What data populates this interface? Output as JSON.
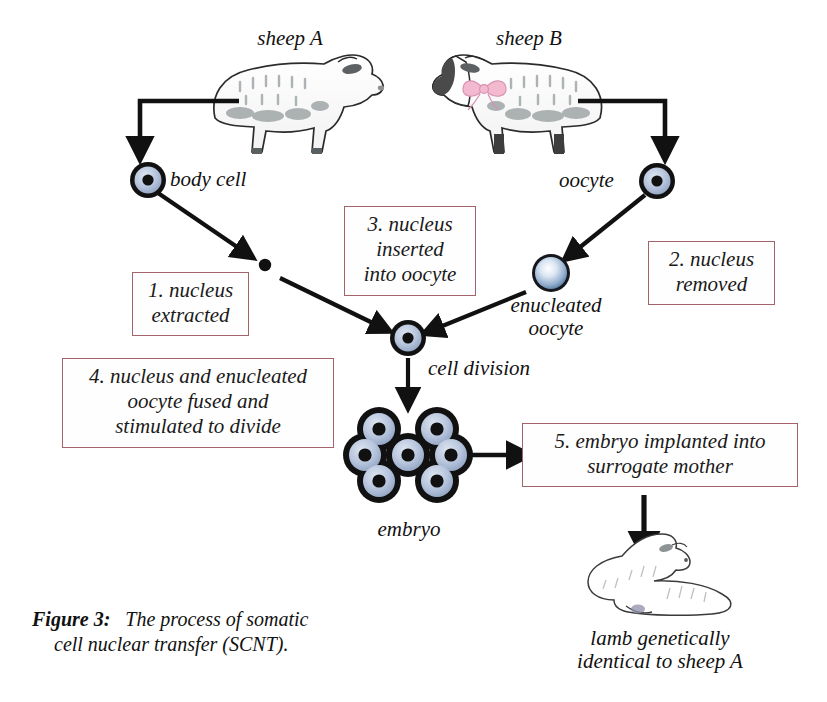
{
  "figure": {
    "caption_bold": "Figure 3:",
    "caption_rest": "The process of somatic",
    "caption_line2": "cell nuclear transfer (SCNT)."
  },
  "colors": {
    "box_border": "#a4636a",
    "cell_ring": "#111111",
    "cell_cytoplasm": "#b9c6de",
    "cell_nucleus": "#111111",
    "enucleated_edge": "#5b7fae",
    "enucleated_center": "#ffffff",
    "arrow": "#111111",
    "text": "#111111",
    "sheep_fleece": "#ffffff",
    "sheep_shading": "#9aa0a2",
    "sheep_b_face": "#4a4a4a",
    "bow_pink": "#f2b9cf"
  },
  "labels": {
    "sheep_a": "sheep A",
    "sheep_b": "sheep B",
    "body_cell": "body cell",
    "oocyte": "oocyte",
    "enucleated_oocyte_line1": "enucleated",
    "enucleated_oocyte_line2": "oocyte",
    "cell_division": "cell division",
    "embryo": "embryo",
    "lamb_line1": "lamb genetically",
    "lamb_line2": "identical to sheep A"
  },
  "steps": [
    {
      "id": "step-1",
      "number": "1.",
      "lines": [
        "1. nucleus",
        "extracted"
      ],
      "text": "1. nucleus extracted"
    },
    {
      "id": "step-2",
      "number": "2.",
      "lines": [
        "2. nucleus",
        "removed"
      ],
      "text": "2. nucleus removed"
    },
    {
      "id": "step-3",
      "number": "3.",
      "lines": [
        "3. nucleus",
        "inserted",
        "into oocyte"
      ],
      "text": "3. nucleus inserted into oocyte"
    },
    {
      "id": "step-4",
      "number": "4.",
      "lines": [
        "4. nucleus and enucleated",
        "oocyte fused and",
        "stimulated to divide"
      ],
      "text": "4. nucleus and enucleated oocyte fused and stimulated to divide"
    },
    {
      "id": "step-5",
      "number": "5.",
      "lines": [
        "5. embryo implanted into",
        "surrogate mother"
      ],
      "text": "5. embryo implanted into surrogate mother"
    }
  ],
  "cells": {
    "body_cell": {
      "type": "nucleated-cell"
    },
    "extracted_nucleus": {
      "type": "nucleus-dot"
    },
    "oocyte": {
      "type": "nucleated-cell"
    },
    "enucleated_oocyte": {
      "type": "enucleated-sphere"
    },
    "fused_cell": {
      "type": "nucleated-cell"
    },
    "embryo": {
      "type": "cell-cluster",
      "cell_count": 7
    }
  }
}
